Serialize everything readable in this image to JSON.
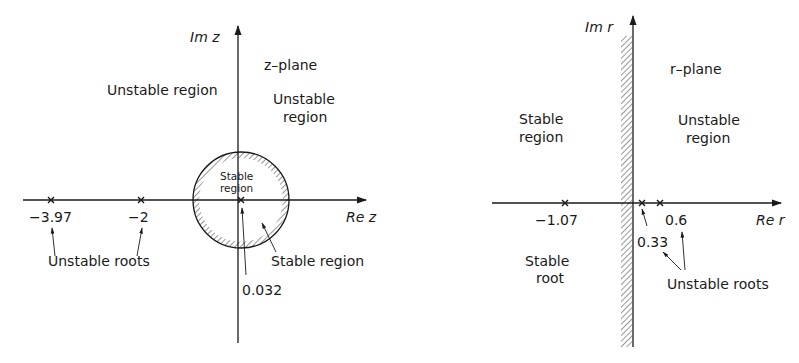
{
  "colors": {
    "ink": "#1a1a1a",
    "background": "#ffffff"
  },
  "z_plane": {
    "title": "z–plane",
    "axis_im_label": "Im z",
    "axis_re_label": "Re z",
    "region_upper_left": "Unstable region",
    "region_upper_right_line1": "Unstable",
    "region_upper_right_line2": "region",
    "circle_label_line1": "Stable",
    "circle_label_line2": "region",
    "circle_annotation": "Stable region",
    "roots": [
      {
        "value": "-3.97",
        "x_label": "−3.97"
      },
      {
        "value": "-2",
        "x_label": "−2"
      },
      {
        "value": "0.032",
        "x_label": "0.032"
      }
    ],
    "roots_annotation": "Unstable roots",
    "root_small_label": "0.032"
  },
  "r_plane": {
    "title": "r–plane",
    "axis_im_label": "Im r",
    "axis_re_label": "Re r",
    "region_left_line1": "Stable",
    "region_left_line2": "region",
    "region_right_line1": "Unstable",
    "region_right_line2": "region",
    "roots": [
      {
        "value": "-1.07",
        "x_label": "−1.07"
      },
      {
        "value": "0.33",
        "x_label": "0.33"
      },
      {
        "value": "0.6",
        "x_label": "0.6"
      }
    ],
    "stable_root_line1": "Stable",
    "stable_root_line2": "root",
    "unstable_roots_annotation": "Unstable roots"
  }
}
